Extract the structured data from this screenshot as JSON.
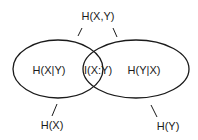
{
  "diagram": {
    "type": "venn",
    "colors": {
      "stroke": "#1a1a1a",
      "background": "#ffffff",
      "text": "#1a1a1a"
    },
    "labels": {
      "joint": "H(X,Y)",
      "cond_x_given_y": "H(X|Y)",
      "mutual": "I(X:Y)",
      "cond_y_given_x": "H(Y|X)",
      "entropy_x": "H(X)",
      "entropy_y": "H(Y)"
    },
    "sets": [
      {
        "name": "X",
        "label": "H(X)"
      },
      {
        "name": "Y",
        "label": "H(Y)"
      }
    ],
    "regions": [
      {
        "region": "X only",
        "label": "H(X|Y)"
      },
      {
        "region": "X and Y",
        "label": "I(X:Y)"
      },
      {
        "region": "Y only",
        "label": "H(Y|X)"
      },
      {
        "region": "X or Y",
        "label": "H(X,Y)"
      }
    ]
  }
}
